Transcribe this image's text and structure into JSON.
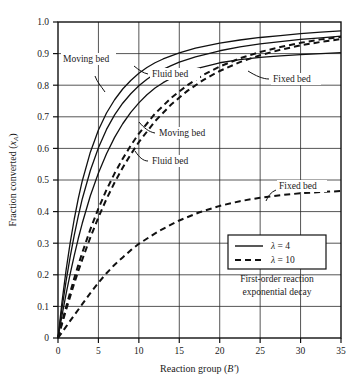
{
  "chart_data": {
    "type": "line",
    "title": "",
    "xlabel": "Reaction group (B′)",
    "ylabel": "Fraction converted (x_A)",
    "xlabel_main": "Reaction group (",
    "xlabel_sym": "B′",
    "xlabel_tail": ")",
    "ylabel_main": "Fraction converted (",
    "ylabel_sym": "x",
    "ylabel_sub": "A",
    "ylabel_tail": ")",
    "xlim": [
      0,
      35
    ],
    "ylim": [
      0,
      1.0
    ],
    "grid": true,
    "xticks": [
      0,
      5,
      10,
      15,
      20,
      25,
      30,
      35
    ],
    "xtick_labels": [
      "0",
      "5",
      "10",
      "15",
      "20",
      "25",
      "30",
      "35"
    ],
    "yticks": [
      0,
      0.1,
      0.2,
      0.3,
      0.4,
      0.5,
      0.6,
      0.7,
      0.8,
      0.9,
      1.0
    ],
    "ytick_labels": [
      "0",
      "0.1",
      "0.2",
      "0.3",
      "0.4",
      "0.5",
      "0.6",
      "0.7",
      "0.8",
      "0.9",
      "1.0"
    ],
    "annotation": "First-order reaction exponential decay",
    "annotation_line1": "First-order reaction",
    "annotation_line2": "exponential decay",
    "legend_position": "lower-right-inside",
    "legend": [
      {
        "label": "λ = 4",
        "sym": "λ",
        "value": "= 4",
        "style": "solid"
      },
      {
        "label": "λ = 10",
        "sym": "λ",
        "value": "= 10",
        "style": "dashed"
      }
    ],
    "curve_labels": [
      {
        "name": "moving-bed-solid",
        "text": "Moving bed",
        "x": 2.0,
        "y": 0.875
      },
      {
        "name": "fluid-bed-solid",
        "text": "Fluid bed",
        "x": 10.3,
        "y": 0.865
      },
      {
        "name": "fixed-bed-solid",
        "text": "Fixed bed",
        "x": 23.8,
        "y": 0.825
      },
      {
        "name": "moving-bed-dashed",
        "text": "Moving bed",
        "x": 12.3,
        "y": 0.64
      },
      {
        "name": "fluid-bed-dashed",
        "text": "Fluid bed",
        "x": 11.3,
        "y": 0.555
      },
      {
        "name": "fixed-bed-dashed",
        "text": "Fixed bed",
        "x": 25.5,
        "y": 0.492
      }
    ],
    "series": [
      {
        "name": "Moving bed, λ = 4",
        "style": "solid",
        "x": [
          0,
          0.5,
          1,
          1.5,
          2,
          2.5,
          3,
          4,
          5,
          6,
          7,
          8,
          9,
          10,
          11,
          12,
          13,
          14,
          15,
          17,
          20,
          22.5,
          25,
          27.5,
          30,
          32.5,
          35
        ],
        "y": [
          0,
          0.115,
          0.215,
          0.3,
          0.375,
          0.44,
          0.497,
          0.588,
          0.658,
          0.712,
          0.754,
          0.788,
          0.815,
          0.838,
          0.856,
          0.871,
          0.883,
          0.893,
          0.902,
          0.917,
          0.933,
          0.943,
          0.951,
          0.957,
          0.963,
          0.968,
          0.972
        ]
      },
      {
        "name": "Fluid bed, λ = 4",
        "style": "solid",
        "x": [
          0,
          0.5,
          1,
          1.5,
          2,
          2.5,
          3,
          4,
          5,
          6,
          7,
          8,
          9,
          10,
          11,
          12,
          13,
          14,
          15,
          17,
          20,
          22.5,
          25,
          27.5,
          30,
          32.5,
          35
        ],
        "y": [
          0,
          0.095,
          0.18,
          0.256,
          0.324,
          0.385,
          0.44,
          0.53,
          0.602,
          0.66,
          0.706,
          0.743,
          0.773,
          0.798,
          0.819,
          0.836,
          0.85,
          0.862,
          0.873,
          0.89,
          0.909,
          0.921,
          0.931,
          0.938,
          0.945,
          0.95,
          0.955
        ]
      },
      {
        "name": "Fixed bed, λ = 4",
        "style": "solid",
        "x": [
          0,
          0.5,
          1,
          1.5,
          2,
          2.5,
          3,
          4,
          5,
          6,
          7,
          8,
          9,
          10,
          11,
          12,
          13,
          14,
          15,
          17,
          20,
          22.5,
          25,
          27.5,
          30,
          32.5,
          35
        ],
        "y": [
          0,
          0.072,
          0.14,
          0.202,
          0.26,
          0.314,
          0.363,
          0.45,
          0.522,
          0.583,
          0.635,
          0.678,
          0.714,
          0.744,
          0.77,
          0.791,
          0.808,
          0.822,
          0.834,
          0.852,
          0.871,
          0.881,
          0.888,
          0.893,
          0.897,
          0.9,
          0.903
        ]
      },
      {
        "name": "Moving bed, λ = 10",
        "style": "dashed",
        "x": [
          0,
          0.5,
          1,
          1.5,
          2,
          2.5,
          3,
          4,
          5,
          6,
          7,
          8,
          9,
          10,
          12,
          14,
          16,
          18,
          20,
          22.5,
          25,
          27.5,
          30,
          32.5,
          35
        ],
        "y": [
          0,
          0.05,
          0.098,
          0.144,
          0.188,
          0.23,
          0.27,
          0.344,
          0.41,
          0.469,
          0.521,
          0.567,
          0.609,
          0.647,
          0.71,
          0.76,
          0.8,
          0.833,
          0.859,
          0.885,
          0.905,
          0.921,
          0.934,
          0.945,
          0.953
        ]
      },
      {
        "name": "Fluid bed, λ = 10",
        "style": "dashed",
        "x": [
          0,
          0.5,
          1,
          1.5,
          2,
          2.5,
          3,
          4,
          5,
          6,
          7,
          8,
          9,
          10,
          12,
          14,
          16,
          18,
          20,
          22.5,
          25,
          27.5,
          30,
          32.5,
          35
        ],
        "y": [
          0,
          0.045,
          0.089,
          0.131,
          0.172,
          0.211,
          0.248,
          0.318,
          0.382,
          0.44,
          0.492,
          0.539,
          0.581,
          0.62,
          0.686,
          0.739,
          0.782,
          0.817,
          0.845,
          0.873,
          0.895,
          0.912,
          0.926,
          0.937,
          0.946
        ]
      },
      {
        "name": "Fixed bed, λ = 10",
        "style": "dashed",
        "x": [
          0,
          1,
          2,
          3,
          4,
          5,
          6,
          7,
          8,
          9,
          10,
          12.5,
          15,
          17.5,
          20,
          22.5,
          25,
          27.5,
          30,
          32.5,
          35
        ],
        "y": [
          0,
          0.036,
          0.072,
          0.107,
          0.142,
          0.175,
          0.205,
          0.232,
          0.255,
          0.278,
          0.298,
          0.339,
          0.372,
          0.398,
          0.418,
          0.433,
          0.444,
          0.452,
          0.458,
          0.462,
          0.465
        ]
      }
    ]
  },
  "plot_geometry": {
    "left": 58,
    "right": 341,
    "top": 22,
    "bottom": 338
  }
}
